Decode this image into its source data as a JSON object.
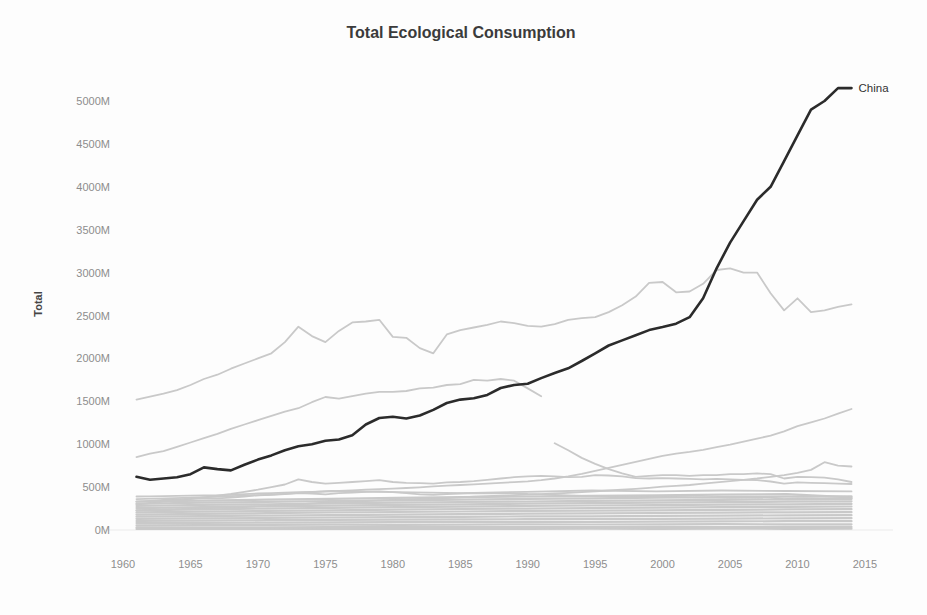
{
  "chart_data": {
    "type": "line",
    "title": "Total Ecological Consumption",
    "xlabel": "",
    "ylabel": "Total",
    "xlim": [
      1960,
      2015
    ],
    "ylim": [
      0,
      5000
    ],
    "grid": false,
    "legend_position": "none",
    "colors": {
      "highlight": "#2b2b2b",
      "muted": "#c9c9c9",
      "baseline": "#ececec"
    },
    "yticks": [
      {
        "v": 0,
        "label": "0M"
      },
      {
        "v": 500,
        "label": "500M"
      },
      {
        "v": 1000,
        "label": "1000M"
      },
      {
        "v": 1500,
        "label": "1500M"
      },
      {
        "v": 2000,
        "label": "2000M"
      },
      {
        "v": 2500,
        "label": "2500M"
      },
      {
        "v": 3000,
        "label": "3000M"
      },
      {
        "v": 3500,
        "label": "3500M"
      },
      {
        "v": 4000,
        "label": "4000M"
      },
      {
        "v": 4500,
        "label": "4500M"
      },
      {
        "v": 5000,
        "label": "5000M"
      }
    ],
    "xticks": [
      {
        "v": 1960,
        "label": "1960"
      },
      {
        "v": 1965,
        "label": "1965"
      },
      {
        "v": 1970,
        "label": "1970"
      },
      {
        "v": 1975,
        "label": "1975"
      },
      {
        "v": 1980,
        "label": "1980"
      },
      {
        "v": 1985,
        "label": "1985"
      },
      {
        "v": 1990,
        "label": "1990"
      },
      {
        "v": 1995,
        "label": "1995"
      },
      {
        "v": 2000,
        "label": "2000"
      },
      {
        "v": 2005,
        "label": "2005"
      },
      {
        "v": 2010,
        "label": "2010"
      },
      {
        "v": 2015,
        "label": "2015"
      }
    ],
    "series": [
      {
        "name": "gray-line-1",
        "label": "",
        "start_year": 1961,
        "values": [
          1520,
          1555,
          1590,
          1630,
          1690,
          1760,
          1810,
          1880,
          1940,
          2000,
          2060,
          2190,
          2370,
          2260,
          2190,
          2320,
          2420,
          2430,
          2450,
          2250,
          2240,
          2120,
          2060,
          2280,
          2330,
          2360,
          2390,
          2430,
          2410,
          2380,
          2370,
          2400,
          2450,
          2470,
          2480,
          2540,
          2620,
          2720,
          2880,
          2890,
          2770,
          2780,
          2870,
          3030,
          3050,
          3000,
          3000,
          2760,
          2560,
          2700,
          2540,
          2560,
          2600,
          2630
        ]
      },
      {
        "name": "gray-line-2",
        "label": "",
        "start_year": 1961,
        "values": [
          850,
          890,
          920,
          970,
          1020,
          1070,
          1120,
          1180,
          1230,
          1280,
          1330,
          1380,
          1420,
          1490,
          1550,
          1530,
          1560,
          1590,
          1610,
          1610,
          1620,
          1650,
          1660,
          1690,
          1700,
          1750,
          1740,
          1760,
          1740,
          1650,
          1560
        ]
      },
      {
        "name": "gray-line-3",
        "label": "",
        "start_year": 1992,
        "values": [
          1010,
          930,
          840,
          770,
          710,
          660,
          620,
          630,
          640,
          640,
          630,
          640,
          640,
          650,
          650,
          660,
          650,
          600,
          620,
          615,
          610,
          590,
          560
        ]
      },
      {
        "name": "gray-line-4",
        "label": "",
        "start_year": 1961,
        "values": [
          390,
          392,
          395,
          398,
          400,
          402,
          405,
          410,
          418,
          425,
          430,
          435,
          440,
          445,
          450,
          455,
          462,
          470,
          476,
          482,
          490,
          498,
          508,
          516,
          525,
          532,
          540,
          550,
          558,
          568,
          580,
          600,
          625,
          655,
          690,
          725,
          760,
          795,
          830,
          865,
          890,
          910,
          935,
          965,
          995,
          1030,
          1065,
          1100,
          1150,
          1210,
          1255,
          1300,
          1355,
          1410
        ]
      },
      {
        "name": "gray-line-5",
        "label": "",
        "start_year": 1961,
        "values": [
          230,
          235,
          240,
          244,
          248,
          252,
          257,
          262,
          268,
          275,
          282,
          290,
          300,
          310,
          318,
          325,
          332,
          338,
          345,
          352,
          358,
          362,
          366,
          372,
          380,
          388,
          394,
          400,
          406,
          412,
          418,
          425,
          432,
          440,
          450,
          460,
          470,
          480,
          492,
          505,
          515,
          525,
          540,
          555,
          570,
          585,
          600,
          620,
          640,
          665,
          700,
          790,
          750,
          740
        ]
      },
      {
        "name": "gray-line-6",
        "label": "",
        "start_year": 1961,
        "values": [
          300,
          315,
          330,
          345,
          360,
          380,
          400,
          420,
          445,
          470,
          500,
          530,
          590,
          560,
          540,
          550,
          560,
          570,
          580,
          560,
          550,
          545,
          540,
          555,
          560,
          570,
          585,
          600,
          615,
          625,
          630,
          625,
          615,
          620,
          640,
          635,
          625,
          605,
          600,
          605,
          600,
          595,
          590,
          595,
          590,
          585,
          580,
          565,
          540,
          555,
          550,
          545,
          540,
          536
        ]
      },
      {
        "name": "gray-line-7",
        "label": "",
        "start_year": 1961,
        "values": [
          330,
          340,
          350,
          358,
          365,
          370,
          368,
          378,
          390,
          405,
          410,
          418,
          430,
          425,
          415,
          430,
          435,
          445,
          450,
          440,
          430,
          415,
          410,
          420,
          425,
          430,
          428,
          430,
          428,
          420,
          415,
          408,
          402,
          398,
          395,
          396,
          398,
          395,
          390,
          388,
          385,
          380,
          378,
          376,
          375,
          378,
          380,
          378,
          360,
          370,
          368,
          366,
          368,
          370
        ]
      },
      {
        "name": "gray-line-8",
        "label": "",
        "start_year": 1961,
        "end_year": 2014,
        "values": [
          360,
          380,
          410,
          455,
          440,
          430,
          445,
          460,
          450,
          460,
          455,
          450
        ]
      },
      {
        "name": "gray-band-1",
        "label": "",
        "start_year": 1961,
        "end_year": 2014,
        "values": [
          12,
          13,
          12,
          14,
          13,
          14,
          13,
          15,
          14,
          15,
          14,
          15
        ]
      },
      {
        "name": "gray-band-2",
        "label": "",
        "start_year": 1961,
        "end_year": 2014,
        "values": [
          30,
          32,
          31,
          33,
          34,
          33,
          35,
          34,
          36,
          35,
          37,
          36
        ]
      },
      {
        "name": "gray-band-3",
        "label": "",
        "start_year": 1961,
        "end_year": 2014,
        "values": [
          55,
          58,
          60,
          62,
          60,
          63,
          65,
          64,
          66,
          68,
          66,
          67
        ]
      },
      {
        "name": "gray-band-4",
        "label": "",
        "start_year": 1961,
        "end_year": 2014,
        "values": [
          80,
          84,
          86,
          90,
          92,
          94,
          96,
          95,
          98,
          100,
          102,
          103
        ]
      },
      {
        "name": "gray-band-5",
        "label": "",
        "start_year": 1961,
        "end_year": 2014,
        "values": [
          105,
          110,
          114,
          118,
          120,
          123,
          126,
          128,
          130,
          133,
          135,
          137
        ]
      },
      {
        "name": "gray-band-6",
        "label": "",
        "start_year": 1961,
        "end_year": 2014,
        "values": [
          130,
          136,
          140,
          146,
          150,
          154,
          158,
          160,
          164,
          168,
          170,
          172
        ]
      },
      {
        "name": "gray-band-7",
        "label": "",
        "start_year": 1961,
        "end_year": 2014,
        "values": [
          155,
          162,
          168,
          174,
          180,
          185,
          190,
          194,
          198,
          202,
          206,
          208
        ]
      },
      {
        "name": "gray-band-8",
        "label": "",
        "start_year": 1961,
        "end_year": 2014,
        "values": [
          180,
          188,
          196,
          204,
          210,
          216,
          222,
          226,
          230,
          236,
          240,
          243
        ]
      },
      {
        "name": "gray-band-9",
        "label": "",
        "start_year": 1961,
        "end_year": 2014,
        "values": [
          205,
          214,
          222,
          230,
          238,
          245,
          250,
          256,
          260,
          266,
          270,
          274
        ]
      },
      {
        "name": "gray-band-10",
        "label": "",
        "start_year": 1961,
        "end_year": 2014,
        "values": [
          230,
          240,
          250,
          258,
          266,
          272,
          280,
          286,
          290,
          296,
          300,
          304
        ]
      },
      {
        "name": "gray-band-11",
        "label": "",
        "start_year": 1961,
        "end_year": 2014,
        "values": [
          255,
          266,
          276,
          284,
          292,
          300,
          306,
          312,
          318,
          324,
          330,
          334
        ]
      },
      {
        "name": "gray-band-12",
        "label": "",
        "start_year": 1961,
        "end_year": 2014,
        "values": [
          280,
          292,
          300,
          310,
          318,
          326,
          332,
          340,
          346,
          352,
          358,
          362
        ]
      },
      {
        "name": "gray-band-13",
        "label": "",
        "start_year": 1961,
        "end_year": 2014,
        "values": [
          305,
          318,
          328,
          338,
          346,
          354,
          362,
          368,
          376,
          382,
          388,
          392
        ]
      },
      {
        "name": "gray-band-14",
        "label": "",
        "start_year": 1961,
        "end_year": 2014,
        "values": [
          330,
          342,
          354,
          364,
          374,
          382,
          390,
          398,
          404,
          412,
          418,
          380
        ]
      },
      {
        "name": "china",
        "label": "China",
        "end_label": "China",
        "emphasis": true,
        "start_year": 1961,
        "values": [
          620,
          585,
          600,
          615,
          650,
          730,
          710,
          695,
          760,
          820,
          870,
          930,
          975,
          1000,
          1040,
          1055,
          1105,
          1230,
          1305,
          1320,
          1300,
          1335,
          1400,
          1480,
          1520,
          1535,
          1575,
          1655,
          1690,
          1705,
          1770,
          1830,
          1885,
          1970,
          2060,
          2150,
          2210,
          2270,
          2330,
          2365,
          2405,
          2480,
          2700,
          3050,
          3350,
          3600,
          3850,
          4000,
          4300,
          4600,
          4900,
          5000,
          5150,
          5150
        ]
      }
    ]
  }
}
